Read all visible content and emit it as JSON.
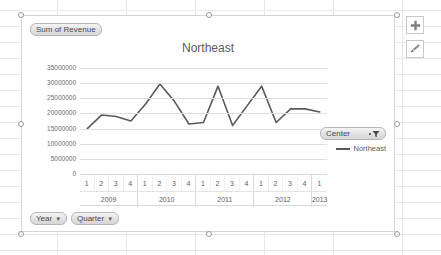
{
  "chart_data": {
    "type": "line",
    "title": "Northeast",
    "xlabel": "",
    "ylabel": "",
    "grid": true,
    "legend_position": "right",
    "ylim": [
      0,
      35000000
    ],
    "ytick_values": [
      35000000,
      30000000,
      25000000,
      20000000,
      15000000,
      10000000,
      5000000,
      0
    ],
    "ytick_labels": [
      "35000000",
      "30000000",
      "25000000",
      "20000000",
      "15000000",
      "10000000",
      "5000000",
      "0"
    ],
    "x_groups": [
      {
        "year": "2009",
        "quarters": [
          "1",
          "2",
          "3",
          "4"
        ]
      },
      {
        "year": "2010",
        "quarters": [
          "1",
          "2",
          "3",
          "4"
        ]
      },
      {
        "year": "2011",
        "quarters": [
          "1",
          "2",
          "3",
          "4"
        ]
      },
      {
        "year": "2012",
        "quarters": [
          "1",
          "2",
          "3",
          "4"
        ]
      },
      {
        "year": "2013",
        "quarters": [
          "1"
        ]
      }
    ],
    "categories": [
      "2009 Q1",
      "2009 Q2",
      "2009 Q3",
      "2009 Q4",
      "2010 Q1",
      "2010 Q2",
      "2010 Q3",
      "2010 Q4",
      "2011 Q1",
      "2011 Q2",
      "2011 Q3",
      "2011 Q4",
      "2012 Q1",
      "2012 Q2",
      "2012 Q3",
      "2012 Q4",
      "2013 Q1"
    ],
    "series": [
      {
        "name": "Northeast",
        "color": "#595959",
        "values": [
          15000000,
          19500000,
          19000000,
          17500000,
          23000000,
          29700000,
          24000000,
          16500000,
          17000000,
          29000000,
          16000000,
          22500000,
          29000000,
          17000000,
          21500000,
          21500000,
          20500000
        ]
      }
    ]
  },
  "pivot_buttons": {
    "values_field": "Sum of Revenue",
    "row_field_1": "Year",
    "row_field_2": "Quarter",
    "legend_field": "Center",
    "caret_glyph": "▼"
  },
  "legend": {
    "entries": [
      {
        "label": "Northeast",
        "color": "#595959"
      }
    ]
  },
  "chart_tools": {
    "elements_label": "+",
    "elements_name": "Chart Elements",
    "styles_name": "Chart Styles"
  }
}
